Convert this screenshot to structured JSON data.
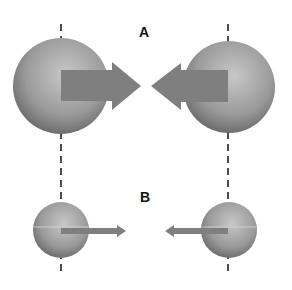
{
  "labels": {
    "a": "A",
    "b": "B"
  },
  "colors": {
    "sphere_light": "#c4c4c4",
    "sphere_dark": "#6e6e6e",
    "arrow": "#808080",
    "axis": "#111111",
    "background": "#ffffff"
  },
  "panels": [
    {
      "id": "A",
      "description": "Two large spheres with large arrows pointing toward each other"
    },
    {
      "id": "B",
      "description": "Two small spheres with thin arrows pointing toward each other"
    }
  ]
}
